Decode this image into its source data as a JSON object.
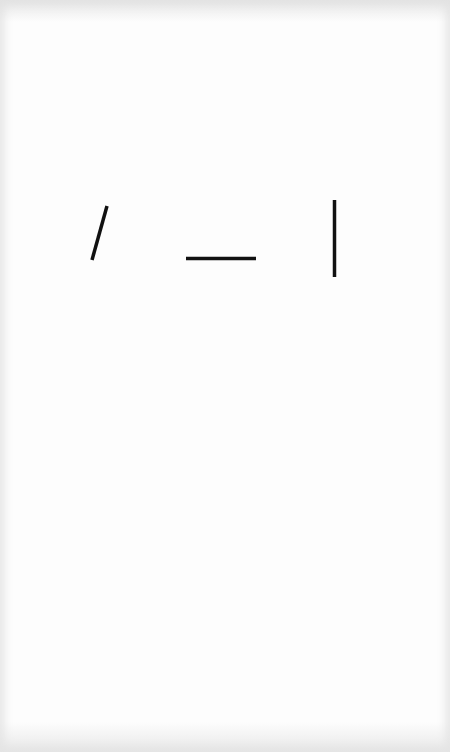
{
  "figure": {
    "background": "#fdfdfd",
    "stroke_color": "#111111",
    "lines": [
      {
        "name": "oblique-line",
        "orientation": "oblique",
        "x1": 107,
        "y1": 206,
        "x2": 92,
        "y2": 260,
        "width": 3.5
      },
      {
        "name": "horizontal-line",
        "orientation": "horizontal",
        "x1": 186,
        "y1": 258.5,
        "x2": 256,
        "y2": 258.5,
        "width": 3.5
      },
      {
        "name": "vertical-line",
        "orientation": "vertical",
        "x1": 334.5,
        "y1": 200,
        "x2": 334.5,
        "y2": 277,
        "width": 3.5
      }
    ]
  }
}
